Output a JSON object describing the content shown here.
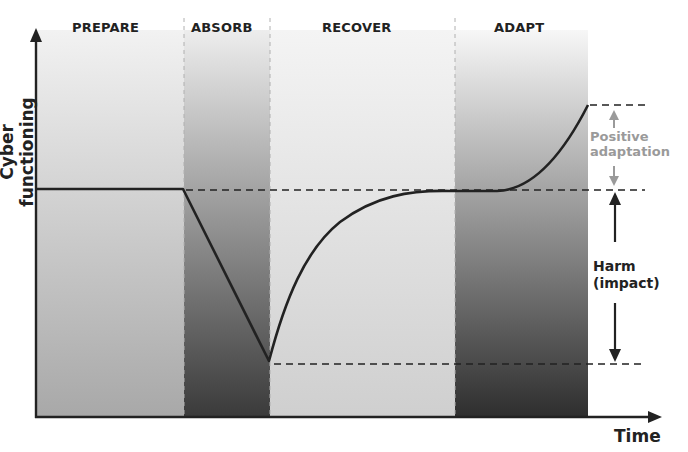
{
  "diagram": {
    "y_axis_label": "Cyber functioning",
    "x_axis_label": "Time",
    "phases": [
      {
        "label": "PREPARE",
        "x0": 37,
        "x1": 184,
        "gradient_top": "#f2f2f2",
        "gradient_bottom": "#a8a8a8",
        "label_x": 72
      },
      {
        "label": "ABSORB",
        "x0": 184,
        "x1": 270,
        "gradient_top": "#ededed",
        "gradient_bottom": "#3a3a3a",
        "label_x": 191
      },
      {
        "label": "RECOVER",
        "x0": 270,
        "x1": 455,
        "gradient_top": "#f4f4f4",
        "gradient_bottom": "#cfcfcf",
        "label_x": 322
      },
      {
        "label": "ADAPT",
        "x0": 455,
        "x1": 588,
        "gradient_top": "#f7f7f7",
        "gradient_bottom": "#2e2e2e",
        "label_x": 494
      }
    ],
    "annotations": {
      "positive_adaptation": [
        "Positive",
        "adaptation"
      ],
      "harm": [
        "Harm",
        "(impact)"
      ]
    },
    "levels": {
      "baseline_y": 190,
      "trough_y": 363,
      "adapted_y": 105
    },
    "colors": {
      "line": "#222222",
      "positive_annotation": "#9a9a9a",
      "harm_annotation": "#222222"
    }
  }
}
